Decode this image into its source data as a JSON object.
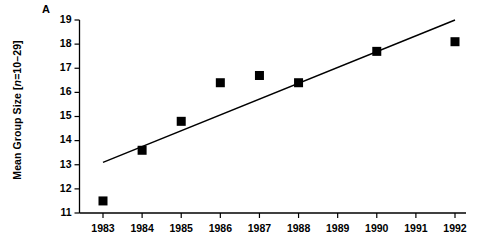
{
  "figure": {
    "panel_label": "A",
    "background_color": "#ffffff",
    "ink_color": "#000000"
  },
  "chart_data": {
    "type": "scatter",
    "title": "",
    "subtitle": "",
    "xlabel": "",
    "ylabel": "Mean Group Size [n=10–29]",
    "ylabel_parts": {
      "prefix": "Mean Group Size [",
      "italic": "n",
      "suffix": "=10–29]"
    },
    "x": [
      1983,
      1984,
      1985,
      1986,
      1987,
      1988,
      1990,
      1992
    ],
    "values": [
      11.5,
      13.6,
      14.8,
      16.4,
      16.7,
      16.4,
      17.7,
      18.1
    ],
    "series": [
      {
        "name": "Mean group size",
        "marker": "filled-square",
        "color": "#000000",
        "points": [
          {
            "x": 1983,
            "y": 11.5
          },
          {
            "x": 1984,
            "y": 13.6
          },
          {
            "x": 1985,
            "y": 14.8
          },
          {
            "x": 1986,
            "y": 16.4
          },
          {
            "x": 1987,
            "y": 16.7
          },
          {
            "x": 1988,
            "y": 16.4
          },
          {
            "x": 1990,
            "y": 17.7
          },
          {
            "x": 1992,
            "y": 18.1
          }
        ]
      },
      {
        "name": "Linear trend",
        "type": "line",
        "color": "#000000",
        "endpoints": [
          {
            "x": 1983,
            "y": 13.1
          },
          {
            "x": 1992,
            "y": 19.0
          }
        ]
      }
    ],
    "xlim": [
      1983,
      1992
    ],
    "ylim": [
      11,
      19
    ],
    "xticks": [
      1983,
      1984,
      1985,
      1986,
      1987,
      1988,
      1989,
      1990,
      1991,
      1992
    ],
    "xtick_labels": [
      "1983",
      "1984",
      "1985",
      "1986",
      "1987",
      "1988",
      "1989",
      "1990",
      "1991",
      "1992"
    ],
    "yticks": [
      11,
      12,
      13,
      14,
      15,
      16,
      17,
      18,
      19
    ],
    "ytick_labels": [
      "11",
      "12",
      "13",
      "14",
      "15",
      "16",
      "17",
      "18",
      "19"
    ],
    "grid": false,
    "legend": "none"
  }
}
